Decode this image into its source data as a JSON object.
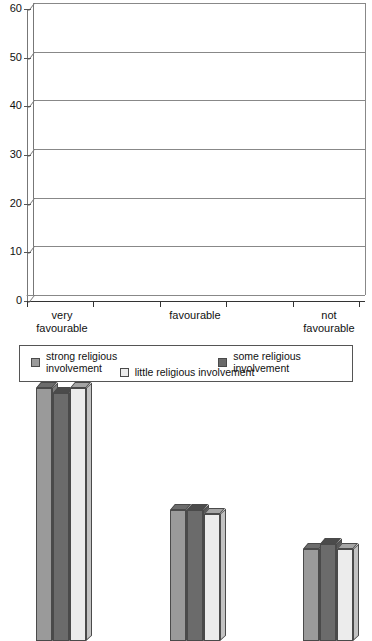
{
  "chart_data": {
    "type": "bar",
    "title": "",
    "subtitle": "",
    "xlabel": "",
    "ylabel": "",
    "categories": [
      "very favourable",
      "favourable",
      "not favourable"
    ],
    "category_lines": [
      [
        "very",
        "favourable"
      ],
      [
        "favourable"
      ],
      [
        "not",
        "favourable"
      ]
    ],
    "series": [
      {
        "name": "strong religious involvement",
        "color": "#9a9a9a",
        "values": [
          52,
          27,
          19
        ]
      },
      {
        "name": "some religious involvement",
        "color": "#6b6b6b",
        "values": [
          51,
          27,
          20
        ]
      },
      {
        "name": "little religious involvement",
        "color": "#ececec",
        "values": [
          52,
          26,
          19
        ]
      }
    ],
    "ylim": [
      0,
      60
    ],
    "ytick_values": [
      0,
      10,
      20,
      30,
      40,
      50,
      60
    ],
    "ytick_labels": [
      "0",
      "10",
      "20",
      "30",
      "40",
      "50",
      "60"
    ],
    "grid": true,
    "grid_axis": "y",
    "legend_position": "bottom",
    "style": "3d-column"
  },
  "legend": {
    "items": [
      {
        "label": "strong religious involvement",
        "color": "#9a9a9a"
      },
      {
        "label": "some religious involvement",
        "color": "#6b6b6b"
      },
      {
        "label": "little religious involvement",
        "color": "#ececec"
      }
    ]
  },
  "axis": {
    "y_ticks": [
      "60",
      "50",
      "40",
      "30",
      "20",
      "10",
      "0"
    ]
  }
}
